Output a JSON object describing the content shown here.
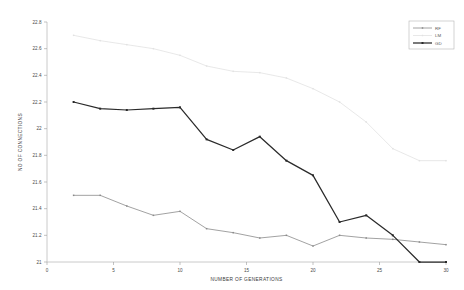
{
  "chart_data": {
    "type": "line",
    "title": "",
    "xlabel": "NUMBER OF GENERATIONS",
    "ylabel": "NO OF CONNECTIONS",
    "xlim": [
      0,
      30
    ],
    "ylim": [
      21,
      22.8
    ],
    "xticks": [
      0,
      5,
      10,
      15,
      20,
      25,
      30
    ],
    "yticks": [
      21,
      21.2,
      21.4,
      21.6,
      21.8,
      22,
      22.2,
      22.4,
      22.6,
      22.8
    ],
    "ytick_labels": [
      "21",
      "21.2",
      "21.4",
      "21.6",
      "21.8",
      "22",
      "22.2",
      "22.4",
      "22.6",
      "22.8"
    ],
    "xtick_labels": [
      "0",
      "5",
      "10",
      "15",
      "20",
      "25",
      "30"
    ],
    "grid": false,
    "legend_position": "top-right",
    "x": [
      2,
      4,
      6,
      8,
      10,
      12,
      14,
      16,
      18,
      20,
      22,
      24,
      26,
      28,
      30
    ],
    "series": [
      {
        "name": "RF",
        "color": "#8a8a8a",
        "marker": "square",
        "values": [
          21.5,
          21.5,
          21.42,
          21.35,
          21.38,
          21.25,
          21.22,
          21.18,
          21.2,
          21.12,
          21.2,
          21.18,
          21.17,
          21.15,
          21.13
        ]
      },
      {
        "name": "LM",
        "color": "#e2e2e2",
        "marker": "square",
        "values": [
          22.7,
          22.66,
          22.63,
          22.6,
          22.55,
          22.47,
          22.43,
          22.42,
          22.38,
          22.3,
          22.2,
          22.05,
          21.85,
          21.76,
          21.76
        ]
      },
      {
        "name": "GD",
        "color": "#2a2a2a",
        "marker": "square",
        "values": [
          22.2,
          22.15,
          22.14,
          22.15,
          22.16,
          21.92,
          21.84,
          21.94,
          21.76,
          21.65,
          21.3,
          21.35,
          21.2,
          21.0,
          21.0
        ]
      }
    ]
  },
  "legend": {
    "entries": [
      {
        "label": "RF"
      },
      {
        "label": "LM"
      },
      {
        "label": "GD"
      }
    ]
  }
}
